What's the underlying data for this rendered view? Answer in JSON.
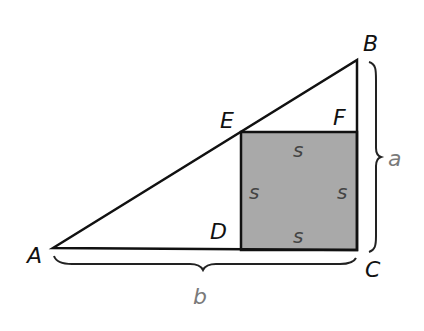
{
  "diagram": {
    "colors": {
      "stroke": "#111111",
      "square_fill": "#a9a9a9",
      "square_label": "#444444",
      "side_label": "#7a7a7a",
      "brace": "#222222"
    },
    "vertices": {
      "A": {
        "label": "A",
        "x": 53,
        "y": 248
      },
      "B": {
        "label": "B",
        "x": 357,
        "y": 60
      },
      "C": {
        "label": "C",
        "x": 357,
        "y": 250
      },
      "D": {
        "label": "D",
        "x": 241,
        "y": 249
      },
      "E": {
        "label": "E",
        "x": 241,
        "y": 132
      },
      "F": {
        "label": "F",
        "x": 357,
        "y": 132
      }
    },
    "square": {
      "side_label": "s",
      "labels": [
        "s",
        "s",
        "s",
        "s"
      ]
    },
    "sides": {
      "a": {
        "label": "a",
        "between": "B-C"
      },
      "b": {
        "label": "b",
        "between": "A-C"
      }
    }
  }
}
